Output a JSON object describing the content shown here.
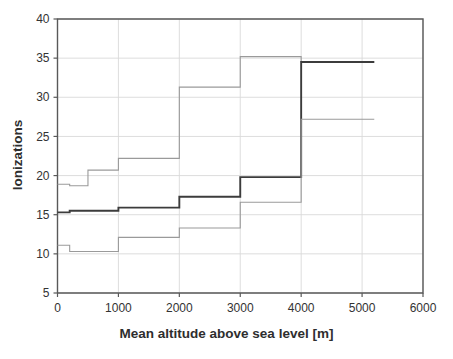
{
  "chart_data": {
    "type": "line",
    "subtype": "step",
    "title": "",
    "subtitle": "",
    "xlabel": "Mean altitude above sea level [m]",
    "ylabel": "Ionizations",
    "xlim": [
      0,
      6000
    ],
    "ylim": [
      5,
      40
    ],
    "xticks": [
      0,
      1000,
      2000,
      3000,
      4000,
      5000,
      6000
    ],
    "yticks": [
      5,
      10,
      15,
      20,
      25,
      30,
      35,
      40
    ],
    "xticklabels": [
      "0",
      "1000",
      "2000",
      "3000",
      "4000",
      "5000",
      "6000"
    ],
    "yticklabels": [
      "5",
      "10",
      "15",
      "20",
      "25",
      "30",
      "35",
      "40"
    ],
    "grid": true,
    "grid_axis": "y-and-x",
    "legend": false,
    "legend_position": "none",
    "series": [
      {
        "name": "upper-bound",
        "color": "#9a9a9a",
        "width": 1.1,
        "step": "post",
        "x": [
          0,
          200,
          500,
          1000,
          2000,
          3000,
          4000,
          5200
        ],
        "y": [
          18.9,
          18.7,
          20.7,
          22.2,
          31.3,
          35.2,
          34.5,
          34.5
        ]
      },
      {
        "name": "mean",
        "color": "#3c3c3c",
        "width": 1.9,
        "step": "post",
        "x": [
          0,
          200,
          1000,
          2000,
          3000,
          4000,
          5200
        ],
        "y": [
          15.3,
          15.5,
          15.9,
          17.3,
          19.8,
          34.5,
          34.5
        ]
      },
      {
        "name": "lower-bound",
        "color": "#9a9a9a",
        "width": 1.1,
        "step": "post",
        "x": [
          0,
          200,
          1000,
          2000,
          3000,
          4000,
          5200
        ],
        "y": [
          11.1,
          10.3,
          12.1,
          13.3,
          16.6,
          27.2,
          27.2
        ]
      }
    ],
    "annotations": []
  },
  "axes": {
    "frame_color": "#595959",
    "grid_color": "#d9d9d9",
    "tick_label_color": "#333333",
    "background": "#ffffff"
  }
}
